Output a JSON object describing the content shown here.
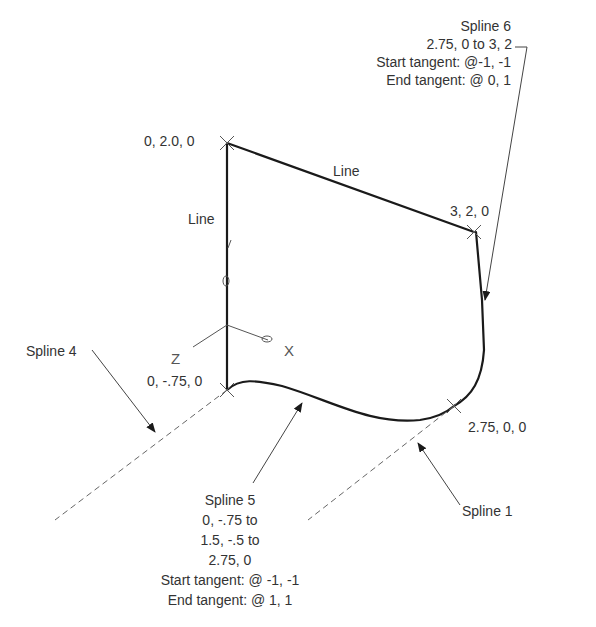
{
  "labels": {
    "spline6": {
      "title": "Spline 6",
      "range": "2.75, 0 to 3, 2",
      "start_tangent": "Start tangent: @-1, -1",
      "end_tangent": "End tangent: @ 0, 1"
    },
    "point_top_left": "0, 2.0, 0",
    "point_top_right": "3, 2, 0",
    "point_bottom_left": "0, -.75, 0",
    "point_bottom_right": "2.75, 0, 0",
    "line_top": "Line",
    "line_left": "Line",
    "spline4": "Spline 4",
    "spline1": "Spline 1",
    "spline5": {
      "title": "Spline 5",
      "line1": "0, -.75 to",
      "line2": "1.5, -.5 to",
      "line3": "2.75, 0",
      "start_tangent": "Start tangent: @ -1, -1",
      "end_tangent": "End tangent: @ 1, 1"
    },
    "axes": {
      "x": "X",
      "y": "Y",
      "z": "Z"
    }
  },
  "colors": {
    "geometry": "#1a1a1a",
    "leader": "#444444",
    "dashed": "#666666",
    "text": "#333333"
  }
}
